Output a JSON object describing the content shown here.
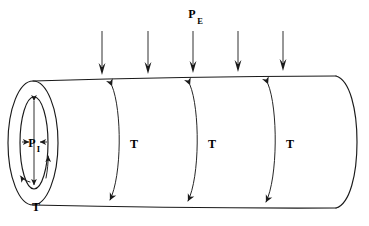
{
  "figure": {
    "title_text": "",
    "background_color": "#ffffff",
    "line_color": "#1a1a1a",
    "labels": {
      "external_pressure": {
        "symbol": "P",
        "subscript": "E",
        "full": "PE"
      },
      "internal_pressure": {
        "symbol": "P",
        "subscript": "I",
        "full": "PI"
      },
      "hoop_tension": "T"
    },
    "external_pressure_arrows": [
      {
        "x": 102,
        "y_start": 31,
        "y_end": 74
      },
      {
        "x": 148,
        "y_start": 31,
        "y_end": 73
      },
      {
        "x": 193,
        "y_start": 31,
        "y_end": 72
      },
      {
        "x": 238,
        "y_start": 31,
        "y_end": 71
      },
      {
        "x": 283,
        "y_start": 31,
        "y_end": 70
      }
    ],
    "hoop_arcs": [
      {
        "id": "arc-1",
        "x_mid": 122,
        "label": "T",
        "label_x": 134,
        "label_y": 148
      },
      {
        "id": "arc-2",
        "x_mid": 200,
        "label": "T",
        "label_x": 212,
        "label_y": 148
      },
      {
        "id": "arc-3",
        "x_mid": 278,
        "label": "T",
        "label_x": 290,
        "label_y": 148
      }
    ],
    "end_cap": {
      "outer_ellipse": {
        "cx": 33,
        "cy": 143,
        "rx": 25,
        "ry": 62
      },
      "inner_ellipse": {
        "cx": 34,
        "cy": 143,
        "rx": 14,
        "ry": 46
      },
      "tension_label": "T",
      "tension_label_x": 36,
      "tension_label_y": 208,
      "pressure_label_x": 34,
      "pressure_label_y": 147
    },
    "body": {
      "top_edge": {
        "x1": 33,
        "y1": 81,
        "x2": 336,
        "y2": 76
      },
      "bottom_edge": {
        "x1": 33,
        "y1": 205,
        "x2": 336,
        "y2": 208
      },
      "right_cap_rx": 22
    }
  }
}
